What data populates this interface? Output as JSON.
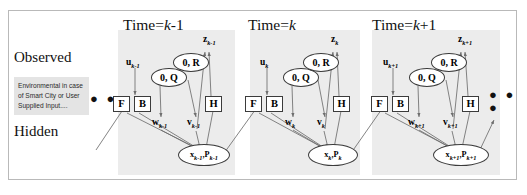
{
  "figure": {
    "left_labels": {
      "observed": "Observed",
      "hidden": "Hidden"
    },
    "info_box": {
      "text": "Environmental in case of Smart City or User Supplied Input...."
    },
    "ellipsis_left": "● ● ●",
    "ellipsis_right": "● ● ●",
    "colors": {
      "band": "#ececec",
      "info_box": "#e4e4e4",
      "frame_border": "#b9b9b9",
      "node_stroke": "#3b3b3b",
      "arrow": "#6e6e6e"
    },
    "slices": [
      {
        "title_prefix": "Time=",
        "title_var": "k",
        "title_suffix": "-1",
        "nodes": {
          "input": "u",
          "input_sub": "k-1",
          "transition_box": "F",
          "control_box": "B",
          "process_noise_cov": "0, Q",
          "measure_noise_cov": "0, R",
          "process_noise": "w",
          "process_noise_sub": "k-1",
          "measure_noise": "v",
          "measure_noise_sub": "k-1",
          "observation_box": "H",
          "measurement": "z",
          "measurement_sub": "k-1",
          "state": "x",
          "state_sub": "k-1",
          "covariance": "P",
          "covariance_sub": "k-1"
        }
      },
      {
        "title_prefix": "Time=",
        "title_var": "k",
        "title_suffix": "",
        "nodes": {
          "input": "u",
          "input_sub": "k",
          "transition_box": "F",
          "control_box": "B",
          "process_noise_cov": "0, Q",
          "measure_noise_cov": "0, R",
          "process_noise": "w",
          "process_noise_sub": "k",
          "measure_noise": "v",
          "measure_noise_sub": "k",
          "observation_box": "H",
          "measurement": "z",
          "measurement_sub": "k",
          "state": "x",
          "state_sub": "k",
          "covariance": "P",
          "covariance_sub": "k"
        }
      },
      {
        "title_prefix": "Time=",
        "title_var": "k",
        "title_suffix": "+1",
        "nodes": {
          "input": "u",
          "input_sub": "k+1",
          "transition_box": "F",
          "control_box": "B",
          "process_noise_cov": "0, Q",
          "measure_noise_cov": "0, R",
          "process_noise": "w",
          "process_noise_sub": "k+1",
          "measure_noise": "v",
          "measure_noise_sub": "k+1",
          "observation_box": "H",
          "measurement": "z",
          "measurement_sub": "k+1",
          "state": "x",
          "state_sub": "k+1",
          "covariance": "P",
          "covariance_sub": "k+1"
        }
      }
    ]
  }
}
